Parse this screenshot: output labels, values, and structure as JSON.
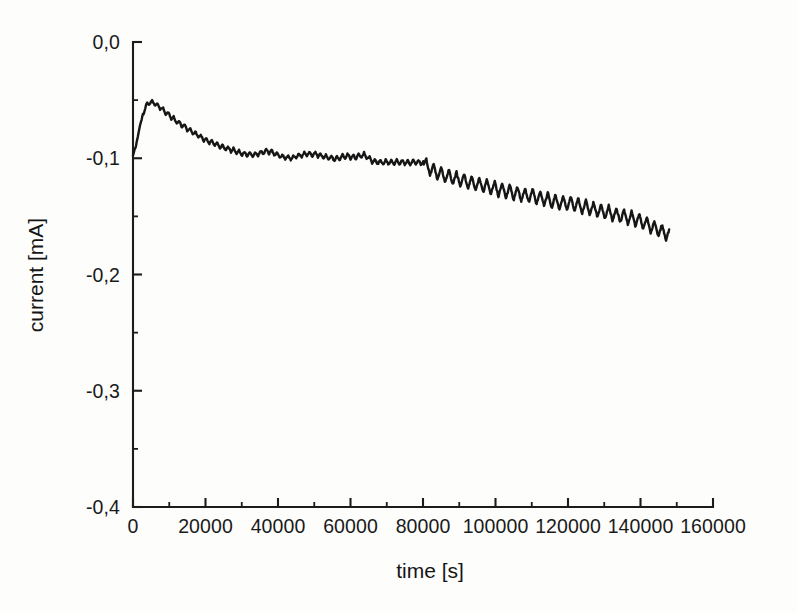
{
  "figure": {
    "background_color": "#fdfdfc",
    "line_color": "#161616",
    "axis_color": "#1c1c1c"
  },
  "axes": {
    "x_label": "time [s]",
    "y_label": "current [mA]",
    "x_ticklabels": [
      "0",
      "20000",
      "40000",
      "60000",
      "80000",
      "100000",
      "120000",
      "140000",
      "160000"
    ],
    "y_ticklabels": [
      "0,0",
      "-0,1",
      "-0,2",
      "-0,3",
      "-0,4"
    ]
  },
  "chart_data": {
    "type": "line",
    "title": "",
    "subtitle": "",
    "xlabel": "time [s]",
    "ylabel": "current [mA]",
    "xlim": [
      0,
      160000
    ],
    "ylim": [
      -0.4,
      0.0
    ],
    "xticks": [
      0,
      20000,
      40000,
      60000,
      80000,
      100000,
      120000,
      140000,
      160000
    ],
    "xticklabels": [
      "0",
      "20000",
      "40000",
      "60000",
      "80000",
      "100000",
      "120000",
      "140000",
      "160000"
    ],
    "x_minor_tick_interval": 10000,
    "yticks": [
      0.0,
      -0.1,
      -0.2,
      -0.3,
      -0.4
    ],
    "yticklabels": [
      "0,0",
      "-0,1",
      "-0,2",
      "-0,3",
      "-0,4"
    ],
    "y_minor_tick_interval": 0.05,
    "grid": false,
    "legend": null,
    "decimal_separator": ",",
    "tick_direction": "in",
    "spines": [
      "left",
      "bottom"
    ],
    "series": [
      {
        "name": "current",
        "line_color": "#161616",
        "line_width": 2.4,
        "marker": "none",
        "noise_description": "fine sawtooth oscillation superimposed on smooth trend; amplitude ~0.002 mA before t=80000 and ~0.006 mA after",
        "annotations": [
          {
            "text": "sharp rise from start to peak",
            "x": 5500,
            "y": -0.051
          },
          {
            "text": "step change / oscillation onset",
            "x": 80000,
            "y": -0.104
          }
        ],
        "x": [
          0,
          900,
          1800,
          2700,
          3600,
          4500,
          5400,
          6300,
          7200,
          8100,
          9000,
          10000,
          11000,
          12000,
          13000,
          14000,
          15000,
          16000,
          17000,
          18000,
          19000,
          20000,
          21000,
          22000,
          23000,
          24000,
          25000,
          26000,
          27000,
          28000,
          29000,
          30000,
          31000,
          32000,
          33000,
          34000,
          35000,
          36000,
          37000,
          38000,
          39000,
          40000,
          41000,
          42000,
          43000,
          44000,
          45000,
          46000,
          47000,
          48000,
          49000,
          50000,
          51000,
          52000,
          53000,
          54000,
          55000,
          56000,
          57000,
          58000,
          59000,
          60000,
          61000,
          62000,
          63000,
          64000,
          65000,
          66000,
          67000,
          68000,
          69000,
          70000,
          71000,
          72000,
          73000,
          74000,
          75000,
          76000,
          77000,
          78000,
          79000,
          80000,
          81000,
          82000,
          83000,
          84000,
          85000,
          86000,
          87000,
          88000,
          89000,
          90000,
          92000,
          94000,
          96000,
          98000,
          100000,
          102000,
          104000,
          106000,
          108000,
          110000,
          112000,
          114000,
          116000,
          118000,
          120000,
          122000,
          124000,
          126000,
          128000,
          130000,
          132000,
          134000,
          136000,
          138000,
          140000,
          142000,
          144000,
          146000,
          148000
        ],
        "y": [
          -0.098,
          -0.088,
          -0.074,
          -0.062,
          -0.055,
          -0.052,
          -0.0515,
          -0.054,
          -0.0555,
          -0.058,
          -0.0605,
          -0.063,
          -0.0655,
          -0.068,
          -0.0705,
          -0.072,
          -0.0745,
          -0.0765,
          -0.0785,
          -0.0805,
          -0.0825,
          -0.084,
          -0.0855,
          -0.0865,
          -0.088,
          -0.0895,
          -0.0905,
          -0.0915,
          -0.0925,
          -0.0935,
          -0.0945,
          -0.0955,
          -0.0965,
          -0.0965,
          -0.097,
          -0.0965,
          -0.0955,
          -0.0945,
          -0.094,
          -0.0945,
          -0.0955,
          -0.0975,
          -0.0985,
          -0.099,
          -0.0995,
          -0.0995,
          -0.0985,
          -0.0975,
          -0.097,
          -0.0965,
          -0.0965,
          -0.0965,
          -0.097,
          -0.098,
          -0.099,
          -0.0995,
          -0.1,
          -0.1005,
          -0.1,
          -0.0985,
          -0.098,
          -0.0985,
          -0.099,
          -0.0985,
          -0.097,
          -0.0975,
          -0.1,
          -0.1025,
          -0.103,
          -0.103,
          -0.1035,
          -0.103,
          -0.1035,
          -0.1035,
          -0.1035,
          -0.1035,
          -0.1035,
          -0.1035,
          -0.1035,
          -0.1035,
          -0.1035,
          -0.104,
          -0.1065,
          -0.109,
          -0.111,
          -0.1125,
          -0.114,
          -0.115,
          -0.116,
          -0.1165,
          -0.1175,
          -0.1185,
          -0.12,
          -0.1215,
          -0.123,
          -0.1245,
          -0.126,
          -0.1275,
          -0.129,
          -0.1305,
          -0.1315,
          -0.1325,
          -0.134,
          -0.1355,
          -0.137,
          -0.1385,
          -0.139,
          -0.1395,
          -0.1415,
          -0.143,
          -0.1445,
          -0.146,
          -0.1475,
          -0.149,
          -0.1505,
          -0.152,
          -0.154,
          -0.157,
          -0.16,
          -0.163,
          -0.166
        ]
      }
    ]
  }
}
